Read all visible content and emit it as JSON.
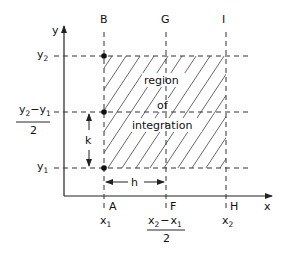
{
  "diagram": {
    "axes": {
      "x_label": "x",
      "y_label": "y"
    },
    "points": {
      "B": "B",
      "G": "G",
      "I": "I",
      "A": "A",
      "F": "F",
      "H": "H"
    },
    "x_ticks": {
      "x1": {
        "base": "x",
        "sub": "1"
      },
      "xmid_num_a": {
        "base": "x",
        "sub": "2"
      },
      "xmid_minus": "−",
      "xmid_num_b": {
        "base": "x",
        "sub": "1"
      },
      "xmid_den": "2",
      "x2": {
        "base": "x",
        "sub": "2"
      }
    },
    "y_ticks": {
      "y2": {
        "base": "y",
        "sub": "2"
      },
      "ymid_num_a": {
        "base": "y",
        "sub": "2"
      },
      "ymid_minus": "−",
      "ymid_num_b": {
        "base": "y",
        "sub": "1"
      },
      "ymid_den": "2",
      "y1": {
        "base": "y",
        "sub": "1"
      }
    },
    "step_labels": {
      "h": "h",
      "k": "k"
    },
    "region_text": [
      "region",
      "of",
      "integration"
    ]
  }
}
